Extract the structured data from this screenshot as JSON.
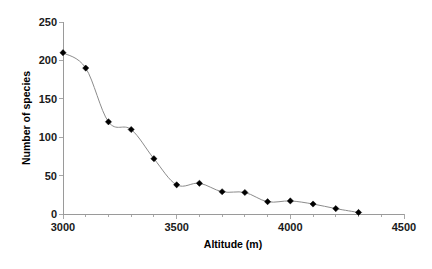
{
  "chart_data": {
    "type": "line",
    "title": "",
    "xlabel": "Altitude (m)",
    "ylabel": "Number of species",
    "xlim": [
      3000,
      4500
    ],
    "ylim": [
      0,
      250
    ],
    "xticks": [
      3000,
      3500,
      4000,
      4500
    ],
    "xtick_labels": [
      "3000",
      "3500",
      "4000",
      "4500"
    ],
    "xminor_ticks": [
      3100,
      3200,
      3300,
      3400,
      3600,
      3700,
      3800,
      3900,
      4100,
      4200,
      4300,
      4400
    ],
    "yticks": [
      0,
      50,
      100,
      150,
      200,
      250
    ],
    "ytick_labels": [
      "0",
      "50",
      "100",
      "150",
      "200",
      "250"
    ],
    "grid": false,
    "legend": false,
    "marker": "diamond",
    "marker_color": "#000000",
    "line_color": "#8c8c8c",
    "x": [
      3000,
      3100,
      3200,
      3300,
      3400,
      3500,
      3600,
      3700,
      3800,
      3900,
      4000,
      4100,
      4200,
      4300
    ],
    "values": [
      210,
      190,
      120,
      110,
      72,
      38,
      40,
      29,
      28,
      16,
      17,
      13,
      7,
      2
    ],
    "series": [
      {
        "name": "Number of species",
        "x": [
          3000,
          3100,
          3200,
          3300,
          3400,
          3500,
          3600,
          3700,
          3800,
          3900,
          4000,
          4100,
          4200,
          4300
        ],
        "values": [
          210,
          190,
          120,
          110,
          72,
          38,
          40,
          29,
          28,
          16,
          17,
          13,
          7,
          2
        ]
      }
    ]
  }
}
